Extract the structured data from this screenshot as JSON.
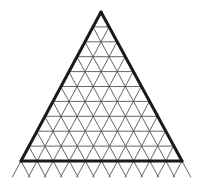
{
  "diagram": {
    "type": "triangular-grid",
    "shape": "equilateral-triangle",
    "rows": 10,
    "apex": [
      101,
      12
    ],
    "base_y": 161,
    "base_left_x": 21,
    "base_right_x": 182,
    "zigzag_bottom_y": 177,
    "colors": {
      "background": "#ffffff",
      "outline": "#1a1a1a",
      "grid": "#555555"
    }
  }
}
